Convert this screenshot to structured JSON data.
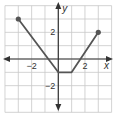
{
  "chart_data": {
    "type": "line",
    "title": "",
    "xlabel": "x",
    "ylabel": "y",
    "xlim": [
      -4,
      4
    ],
    "ylim": [
      -4,
      4
    ],
    "grid": true,
    "x_tick_labels": [
      {
        "value": -2,
        "label": "−2"
      },
      {
        "value": 2,
        "label": "2"
      }
    ],
    "y_tick_labels": [
      {
        "value": 2,
        "label": "2"
      },
      {
        "value": -2,
        "label": "−2"
      }
    ],
    "series": [
      {
        "name": "piecewise graph",
        "points": [
          [
            -3,
            3
          ],
          [
            0,
            -1
          ],
          [
            1,
            -1
          ],
          [
            3,
            2
          ]
        ],
        "endpoints_closed": [
          [
            -3,
            3
          ],
          [
            3,
            2
          ]
        ]
      }
    ],
    "colors": {
      "line": "#555555",
      "grid": "#c8c8c8",
      "axis": "#333333",
      "point": "#555555"
    }
  }
}
